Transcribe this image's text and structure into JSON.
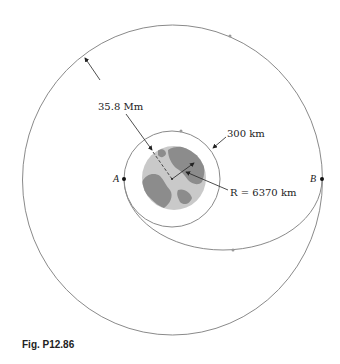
{
  "figure": {
    "caption": "Fig. P12.86",
    "labels": {
      "geo_distance": "35.8 Mm",
      "leo_altitude": "300 km",
      "earth_radius": "R = 6370 km",
      "point_a": "A",
      "point_b": "B"
    },
    "elements": {
      "outer_orbit": "geosynchronous circular orbit",
      "inner_orbit": "low earth circular orbit",
      "transfer_orbit": "elliptical transfer orbit from A to B",
      "earth": "earth globe"
    },
    "colors": {
      "orbit_line": "#8a8a8a",
      "earth_light": "#c9c9c9",
      "earth_dark": "#8c8c8c",
      "ink": "#222222"
    }
  }
}
